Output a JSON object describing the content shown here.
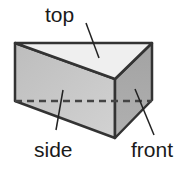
{
  "diagram": {
    "labels": {
      "top": "top",
      "side": "side",
      "front": "front"
    },
    "colors": {
      "top_face": "#efefef",
      "side_face": "#c6c6c6",
      "front_face": "#a9a9a9",
      "edge": "#333333",
      "text": "#1a1a1a"
    }
  }
}
